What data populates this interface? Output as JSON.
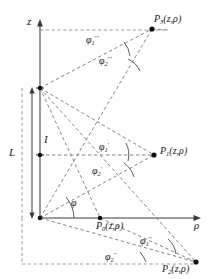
{
  "diagram": {
    "type": "cylindrical-coordinate-geometry",
    "axes": {
      "vertical": {
        "label": "z",
        "direction": "up"
      },
      "horizontal": {
        "label": "ρ",
        "direction": "right"
      }
    },
    "dimensions": [
      {
        "name": "total-length",
        "label": "L"
      },
      {
        "name": "current-element",
        "label": "I"
      }
    ],
    "points": [
      {
        "id": "P0",
        "base": "P",
        "subscript": "0",
        "args": "(z,ρ)",
        "label": "P₀(z,ρ)"
      },
      {
        "id": "P1",
        "base": "P",
        "subscript": "1",
        "args": "(z,ρ)",
        "label": "P₁(z,ρ)"
      },
      {
        "id": "P2",
        "base": "P",
        "subscript": "2",
        "args": "(z,ρ)",
        "label": "P₂(z,ρ)"
      },
      {
        "id": "P3",
        "base": "P",
        "subscript": "3",
        "args": "(z,ρ)",
        "label": "P₃(z,ρ)"
      }
    ],
    "angles": [
      {
        "id": "phi-top-1",
        "base": "φ",
        "subscript": "1",
        "superscript": "′′′"
      },
      {
        "id": "phi-top-2",
        "base": "φ",
        "subscript": "2",
        "superscript": "′′′"
      },
      {
        "id": "phi-mid-1",
        "base": "φ",
        "subscript": "1",
        "superscript": "′"
      },
      {
        "id": "phi-mid-2",
        "base": "φ",
        "subscript": "2",
        "superscript": "′"
      },
      {
        "id": "phi-origin",
        "base": "φ",
        "subscript": "",
        "superscript": ""
      },
      {
        "id": "phi-bot-1",
        "base": "φ",
        "subscript": "1",
        "superscript": "′′"
      },
      {
        "id": "phi-bot-2",
        "base": "φ",
        "subscript": "2",
        "superscript": "′′"
      }
    ],
    "colors": {
      "stroke": "#3a3a3a",
      "dashed": "#555555",
      "text": "#1a1a1a",
      "background": "#ffffff"
    }
  }
}
